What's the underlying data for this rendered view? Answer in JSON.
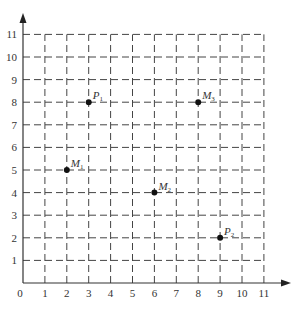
{
  "diagram": {
    "type": "coordinate-grid",
    "x_axis": {
      "ticks": [
        "0",
        "1",
        "2",
        "3",
        "4",
        "5",
        "6",
        "7",
        "8",
        "9",
        "10",
        "11"
      ]
    },
    "y_axis": {
      "ticks": [
        "1",
        "2",
        "3",
        "4",
        "5",
        "6",
        "7",
        "8",
        "9",
        "10",
        "11"
      ]
    },
    "points": [
      {
        "name": "P",
        "sub": "1",
        "x": 3,
        "y": 8
      },
      {
        "name": "M",
        "sub": "3",
        "x": 8,
        "y": 8
      },
      {
        "name": "M",
        "sub": "1",
        "x": 2,
        "y": 5
      },
      {
        "name": "M",
        "sub": "2",
        "x": 6,
        "y": 4
      },
      {
        "name": "P",
        "sub": "2",
        "x": 9,
        "y": 2
      }
    ],
    "colors": {
      "line": "#444444",
      "point": "#111111",
      "text": "#333333"
    }
  }
}
